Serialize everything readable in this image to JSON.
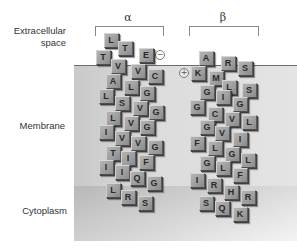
{
  "labels": {
    "extracellular_line1": "Extracellular",
    "extracellular_line2": "space",
    "membrane": "Membrane",
    "cytoplasm": "Cytoplasm"
  },
  "helices": {
    "alpha": {
      "symbol": "α",
      "charge": "−",
      "residues": [
        {
          "aa": "L",
          "x": 111,
          "y": 40
        },
        {
          "aa": "T",
          "x": 103,
          "y": 57
        },
        {
          "aa": "T",
          "x": 125,
          "y": 48
        },
        {
          "aa": "E",
          "x": 146,
          "y": 55
        },
        {
          "aa": "V",
          "x": 118,
          "y": 66
        },
        {
          "aa": "V",
          "x": 138,
          "y": 71
        },
        {
          "aa": "C",
          "x": 155,
          "y": 76
        },
        {
          "aa": "A",
          "x": 113,
          "y": 81
        },
        {
          "aa": "L",
          "x": 131,
          "y": 87
        },
        {
          "aa": "G",
          "x": 147,
          "y": 93
        },
        {
          "aa": "L",
          "x": 106,
          "y": 96
        },
        {
          "aa": "S",
          "x": 122,
          "y": 103
        },
        {
          "aa": "V",
          "x": 140,
          "y": 108
        },
        {
          "aa": "G",
          "x": 156,
          "y": 112
        },
        {
          "aa": "L",
          "x": 113,
          "y": 118
        },
        {
          "aa": "V",
          "x": 131,
          "y": 123
        },
        {
          "aa": "G",
          "x": 147,
          "y": 127
        },
        {
          "aa": "I",
          "x": 106,
          "y": 132
        },
        {
          "aa": "V",
          "x": 122,
          "y": 138
        },
        {
          "aa": "V",
          "x": 138,
          "y": 143
        },
        {
          "aa": "G",
          "x": 155,
          "y": 147
        },
        {
          "aa": "T",
          "x": 113,
          "y": 153
        },
        {
          "aa": "I",
          "x": 128,
          "y": 158
        },
        {
          "aa": "F",
          "x": 146,
          "y": 162
        },
        {
          "aa": "I",
          "x": 106,
          "y": 167
        },
        {
          "aa": "I",
          "x": 122,
          "y": 172
        },
        {
          "aa": "Q",
          "x": 137,
          "y": 178
        },
        {
          "aa": "G",
          "x": 154,
          "y": 183
        },
        {
          "aa": "L",
          "x": 113,
          "y": 190
        },
        {
          "aa": "R",
          "x": 128,
          "y": 197
        },
        {
          "aa": "S",
          "x": 145,
          "y": 203
        }
      ]
    },
    "beta": {
      "symbol": "β",
      "charge": "+",
      "residues": [
        {
          "aa": "A",
          "x": 206,
          "y": 58
        },
        {
          "aa": "R",
          "x": 228,
          "y": 63
        },
        {
          "aa": "S",
          "x": 245,
          "y": 68
        },
        {
          "aa": "K",
          "x": 198,
          "y": 73
        },
        {
          "aa": "M",
          "x": 216,
          "y": 78
        },
        {
          "aa": "L",
          "x": 229,
          "y": 87
        },
        {
          "aa": "S",
          "x": 249,
          "y": 90
        },
        {
          "aa": "G",
          "x": 207,
          "y": 92
        },
        {
          "aa": "I",
          "x": 223,
          "y": 97
        },
        {
          "aa": "G",
          "x": 240,
          "y": 104
        },
        {
          "aa": "G",
          "x": 197,
          "y": 107
        },
        {
          "aa": "C",
          "x": 215,
          "y": 114
        },
        {
          "aa": "V",
          "x": 232,
          "y": 119
        },
        {
          "aa": "L",
          "x": 249,
          "y": 122
        },
        {
          "aa": "G",
          "x": 207,
          "y": 127
        },
        {
          "aa": "V",
          "x": 222,
          "y": 133
        },
        {
          "aa": "I",
          "x": 240,
          "y": 139
        },
        {
          "aa": "F",
          "x": 197,
          "y": 143
        },
        {
          "aa": "L",
          "x": 215,
          "y": 148
        },
        {
          "aa": "G",
          "x": 232,
          "y": 154
        },
        {
          "aa": "L",
          "x": 248,
          "y": 160
        },
        {
          "aa": "G",
          "x": 207,
          "y": 163
        },
        {
          "aa": "L",
          "x": 223,
          "y": 168
        },
        {
          "aa": "F",
          "x": 240,
          "y": 175
        },
        {
          "aa": "I",
          "x": 197,
          "y": 180
        },
        {
          "aa": "R",
          "x": 214,
          "y": 185
        },
        {
          "aa": "H",
          "x": 231,
          "y": 192
        },
        {
          "aa": "R",
          "x": 248,
          "y": 197
        },
        {
          "aa": "S",
          "x": 206,
          "y": 203
        },
        {
          "aa": "Q",
          "x": 222,
          "y": 208
        },
        {
          "aa": "K",
          "x": 240,
          "y": 214
        }
      ]
    }
  }
}
